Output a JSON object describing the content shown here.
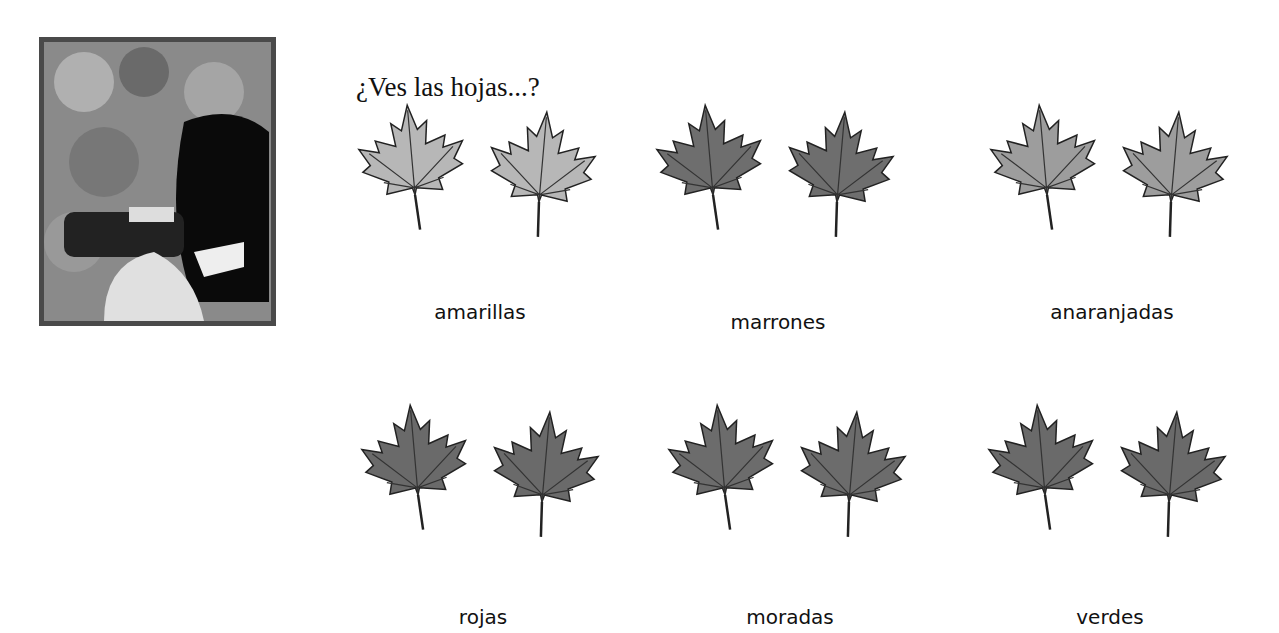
{
  "title": "¿Ves las hojas...?",
  "photo": {
    "description": "child-with-binoculars-photo"
  },
  "leaves": [
    {
      "label": "amarillas",
      "shade": "#b7b7b7"
    },
    {
      "label": "marrones",
      "shade": "#6e6e6e"
    },
    {
      "label": "anaranjadas",
      "shade": "#9d9d9d"
    },
    {
      "label": "rojas",
      "shade": "#6a6a6a"
    },
    {
      "label": "moradas",
      "shade": "#6c6c6c"
    },
    {
      "label": "verdes",
      "shade": "#6a6a6a"
    }
  ]
}
